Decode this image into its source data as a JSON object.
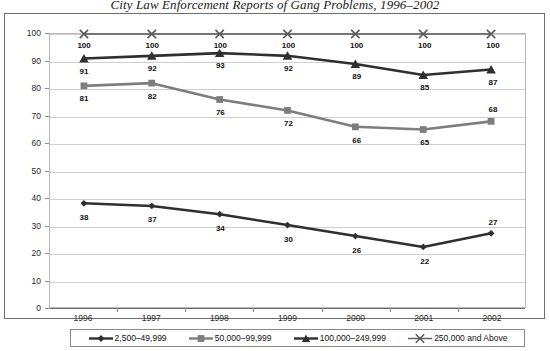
{
  "chart_data": {
    "type": "line",
    "title": "City Law Enforcement Reports of Gang Problems, 1996–2002",
    "xlabel": "",
    "ylabel": "Percent Reporting Gang Problems",
    "categories": [
      "1996",
      "1997",
      "1998",
      "1999",
      "2000",
      "2001",
      "2002"
    ],
    "ylim": [
      0,
      100
    ],
    "yticks": [
      0,
      10,
      20,
      30,
      40,
      50,
      60,
      70,
      80,
      90,
      100
    ],
    "grid": true,
    "legend_position": "bottom",
    "series": [
      {
        "name": "2,500–49,999",
        "marker": "diamond",
        "color": "#2f2f2f",
        "values": [
          38,
          37,
          34,
          30,
          26,
          22,
          27
        ]
      },
      {
        "name": "50,000–99,999",
        "marker": "square",
        "color": "#7d7d7d",
        "values": [
          81,
          82,
          76,
          72,
          66,
          65,
          68
        ]
      },
      {
        "name": "100,000–249,999",
        "marker": "triangle",
        "color": "#2f2f2f",
        "values": [
          91,
          92,
          93,
          92,
          89,
          85,
          87
        ]
      },
      {
        "name": "250,000 and Above",
        "marker": "x",
        "color": "#5a5a5a",
        "values": [
          100,
          100,
          100,
          100,
          100,
          100,
          100
        ]
      }
    ]
  }
}
